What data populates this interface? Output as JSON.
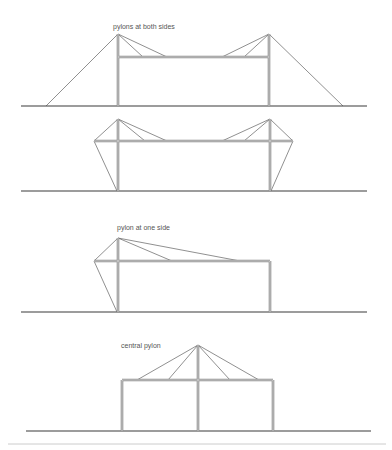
{
  "diagrams": [
    {
      "id": "both-sides",
      "label": "pylons at both sides",
      "label_pos": [
        113,
        29
      ],
      "ground": {
        "y": 106,
        "x1": 21,
        "x2": 367
      },
      "deck": {
        "y": 57,
        "x1": 118,
        "x2": 269
      },
      "columns": [
        {
          "x": 118,
          "y1": 34,
          "y2": 106
        },
        {
          "x": 269,
          "y1": 34,
          "y2": 106
        }
      ],
      "cables": [
        [
          118,
          34,
          46,
          106
        ],
        [
          118,
          34,
          143,
          57
        ],
        [
          118,
          34,
          167,
          57
        ],
        [
          269,
          34,
          343,
          106
        ],
        [
          269,
          34,
          244,
          57
        ],
        [
          269,
          34,
          222,
          57
        ]
      ]
    },
    {
      "id": "both-sides-anchored",
      "label": "",
      "label_pos": [
        0,
        0
      ],
      "ground": {
        "y": 191,
        "x1": 21,
        "x2": 367
      },
      "deck": {
        "y": 141,
        "x1": 94,
        "x2": 293
      },
      "columns": [
        {
          "x": 118,
          "y1": 119,
          "y2": 191
        },
        {
          "x": 270,
          "y1": 119,
          "y2": 191
        }
      ],
      "cables": [
        [
          118,
          119,
          94,
          141
        ],
        [
          94,
          141,
          117,
          191
        ],
        [
          118,
          119,
          145,
          141
        ],
        [
          118,
          119,
          167,
          141
        ],
        [
          270,
          119,
          293,
          141
        ],
        [
          293,
          141,
          271,
          191
        ],
        [
          270,
          119,
          244,
          141
        ],
        [
          270,
          119,
          222,
          141
        ]
      ]
    },
    {
      "id": "one-side",
      "label": "pylon at one side",
      "label_pos": [
        117,
        230
      ],
      "ground": {
        "y": 312,
        "x1": 21,
        "x2": 367
      },
      "deck": {
        "y": 261,
        "x1": 94,
        "x2": 270
      },
      "columns": [
        {
          "x": 118,
          "y1": 238,
          "y2": 312
        },
        {
          "x": 270,
          "y1": 261,
          "y2": 312
        }
      ],
      "cables": [
        [
          118,
          238,
          94,
          261
        ],
        [
          94,
          261,
          117,
          312
        ],
        [
          118,
          238,
          172,
          261
        ],
        [
          118,
          238,
          240,
          261
        ]
      ]
    },
    {
      "id": "central",
      "label": "central pylon",
      "label_pos": [
        121,
        348
      ],
      "ground": {
        "y": 431,
        "x1": 26,
        "x2": 371
      },
      "deck": {
        "y": 380,
        "x1": 122,
        "x2": 273
      },
      "columns": [
        {
          "x": 122,
          "y1": 380,
          "y2": 431
        },
        {
          "x": 198,
          "y1": 345,
          "y2": 431
        },
        {
          "x": 273,
          "y1": 380,
          "y2": 431
        }
      ],
      "cables": [
        [
          198,
          345,
          137,
          380
        ],
        [
          198,
          345,
          168,
          380
        ],
        [
          198,
          345,
          230,
          380
        ],
        [
          198,
          345,
          259,
          380
        ]
      ]
    }
  ],
  "divider": {
    "y": 444,
    "x1": 8,
    "x2": 386
  },
  "colors": {
    "ground": "#3a3a3a",
    "member": "#8a8a8a",
    "cable": "#444444",
    "label": "#555555",
    "divider": "#cccccc"
  }
}
